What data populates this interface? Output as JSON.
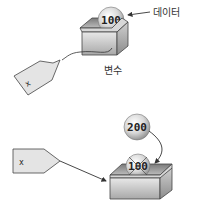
{
  "top_diagram": {
    "ball_value": "100",
    "data_label": "데이터",
    "variable_label": "변수",
    "tag_label": "x"
  },
  "bottom_diagram": {
    "new_ball_value": "200",
    "old_ball_value": "100",
    "tag_label": "x",
    "old_value_crossed_out": true
  },
  "colors": {
    "stroke": "#333333",
    "box_light": "#f2f2f2",
    "box_dark": "#9a9a9a",
    "tag_fill": "#e6e6e6"
  }
}
